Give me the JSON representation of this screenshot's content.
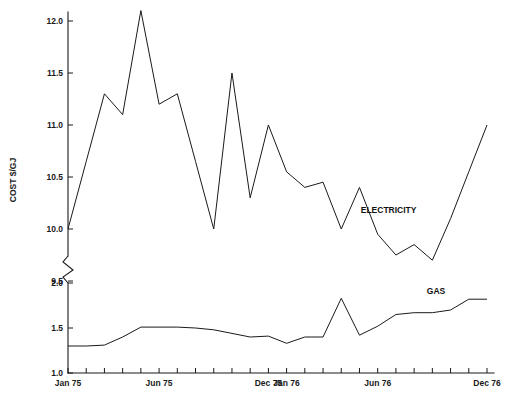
{
  "chart_data": {
    "type": "line",
    "title": "",
    "xlabel": "",
    "ylabel": "COST $/GJ",
    "grid": false,
    "legend_position": "inline-annotation",
    "axis_break": {
      "present": true,
      "between": [
        9.5,
        2.0
      ],
      "note": "broken y-axis with zigzag symbol"
    },
    "y_axis": {
      "upper_segment": {
        "ticks": [
          "9.5",
          "10.0",
          "10.5",
          "11.0",
          "11.5",
          "12.0"
        ],
        "tick_values": [
          9.5,
          10.0,
          10.5,
          11.0,
          11.5,
          12.0
        ],
        "range": [
          9.5,
          12.2
        ]
      },
      "lower_segment": {
        "ticks": [
          "1.0",
          "1.5",
          "2.0"
        ],
        "tick_values": [
          1.0,
          1.5,
          2.0
        ],
        "range": [
          1.0,
          2.0
        ]
      }
    },
    "x_axis": {
      "tick_labels": [
        "Jan 75",
        "Jun 75",
        "Dec 75",
        "Jan 76",
        "Jun 76",
        "Dec 76"
      ],
      "tick_label_months": [
        0,
        5,
        11,
        12,
        17,
        23
      ],
      "months_total": 24,
      "minor_ticks": "monthly"
    },
    "series": [
      {
        "name": "ELECTRICITY",
        "label": "ELECTRICITY",
        "axis": "upper",
        "color": "#1a1a1a",
        "x": [
          0,
          1,
          2,
          3,
          4,
          5,
          6,
          7,
          8,
          9,
          10,
          11,
          12,
          13,
          14,
          15,
          16,
          17,
          18,
          19,
          20,
          21,
          22,
          23
        ],
        "values": [
          10.0,
          10.65,
          11.3,
          11.1,
          12.1,
          11.2,
          11.3,
          10.65,
          10.0,
          11.5,
          10.3,
          11.0,
          10.55,
          10.4,
          10.45,
          10.0,
          10.4,
          9.95,
          9.75,
          9.85,
          9.7,
          10.1,
          10.55,
          11.0
        ]
      },
      {
        "name": "GAS",
        "label": "GAS",
        "axis": "lower",
        "color": "#1a1a1a",
        "x": [
          0,
          1,
          2,
          3,
          4,
          5,
          6,
          7,
          8,
          9,
          10,
          11,
          12,
          13,
          14,
          15,
          16,
          17,
          18,
          19,
          20,
          21,
          22,
          23
        ],
        "values": [
          1.3,
          1.3,
          1.31,
          1.4,
          1.51,
          1.51,
          1.51,
          1.5,
          1.48,
          1.44,
          1.4,
          1.41,
          1.33,
          1.4,
          1.4,
          1.83,
          1.42,
          1.52,
          1.65,
          1.67,
          1.67,
          1.7,
          1.82,
          1.82
        ]
      }
    ],
    "annotations": [
      {
        "text": "ELECTRICITY",
        "x_month": 17.6,
        "y_value": 10.15,
        "series": "ELECTRICITY"
      },
      {
        "text": "GAS",
        "x_month": 20.2,
        "y_value": 1.88,
        "series": "GAS"
      }
    ]
  }
}
